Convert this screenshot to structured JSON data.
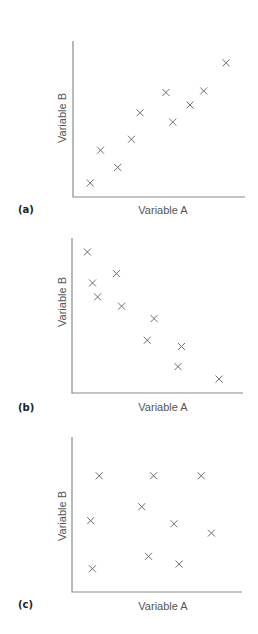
{
  "figure": {
    "panels": [
      {
        "label": "(a)",
        "xlabel": "Variable A",
        "ylabel": "Variable B"
      },
      {
        "label": "(b)",
        "xlabel": "Variable A",
        "ylabel": "Variable B"
      },
      {
        "label": "(c)",
        "xlabel": "Variable A",
        "ylabel": "Variable B"
      }
    ],
    "colors": {
      "axis": "#8a8a8a",
      "marker": "#6e6e6e",
      "text": "#555555"
    }
  },
  "chart_data": [
    {
      "type": "scatter",
      "title": "(a)",
      "description": "positive correlation",
      "xlabel": "Variable A",
      "ylabel": "Variable B",
      "grid": false,
      "ticks": false,
      "marker": "x",
      "xlim": [
        0,
        10
      ],
      "ylim": [
        0,
        10
      ],
      "points": [
        {
          "x": 1.0,
          "y": 0.9
        },
        {
          "x": 1.6,
          "y": 3.0
        },
        {
          "x": 2.6,
          "y": 1.9
        },
        {
          "x": 3.4,
          "y": 3.7
        },
        {
          "x": 3.9,
          "y": 5.4
        },
        {
          "x": 5.4,
          "y": 6.7
        },
        {
          "x": 5.8,
          "y": 4.8
        },
        {
          "x": 6.8,
          "y": 5.9
        },
        {
          "x": 7.6,
          "y": 6.8
        },
        {
          "x": 8.9,
          "y": 8.6
        }
      ]
    },
    {
      "type": "scatter",
      "title": "(b)",
      "description": "negative correlation",
      "xlabel": "Variable A",
      "ylabel": "Variable B",
      "grid": false,
      "ticks": false,
      "marker": "x",
      "xlim": [
        0,
        10
      ],
      "ylim": [
        0,
        10
      ],
      "points": [
        {
          "x": 0.9,
          "y": 9.1
        },
        {
          "x": 1.2,
          "y": 7.1
        },
        {
          "x": 1.5,
          "y": 6.2
        },
        {
          "x": 2.6,
          "y": 7.7
        },
        {
          "x": 2.9,
          "y": 5.6
        },
        {
          "x": 4.8,
          "y": 4.8
        },
        {
          "x": 4.4,
          "y": 3.4
        },
        {
          "x": 6.4,
          "y": 3.0
        },
        {
          "x": 6.2,
          "y": 1.7
        },
        {
          "x": 8.6,
          "y": 0.9
        }
      ]
    },
    {
      "type": "scatter",
      "title": "(c)",
      "description": "no correlation",
      "xlabel": "Variable A",
      "ylabel": "Variable B",
      "grid": false,
      "ticks": false,
      "marker": "x",
      "xlim": [
        0,
        10
      ],
      "ylim": [
        0,
        10
      ],
      "points": [
        {
          "x": 1.6,
          "y": 7.5
        },
        {
          "x": 4.8,
          "y": 7.5
        },
        {
          "x": 7.6,
          "y": 7.5
        },
        {
          "x": 4.1,
          "y": 5.5
        },
        {
          "x": 1.1,
          "y": 4.6
        },
        {
          "x": 6.0,
          "y": 4.4
        },
        {
          "x": 8.2,
          "y": 3.8
        },
        {
          "x": 4.5,
          "y": 2.3
        },
        {
          "x": 6.3,
          "y": 1.8
        },
        {
          "x": 1.2,
          "y": 1.5
        }
      ]
    }
  ]
}
